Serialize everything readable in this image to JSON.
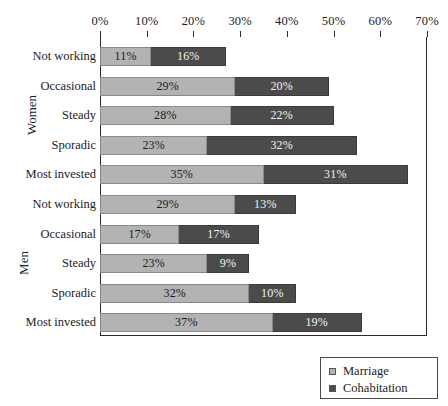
{
  "chart_data": {
    "type": "bar",
    "orientation": "horizontal",
    "stacked": true,
    "title": "",
    "xlabel": "",
    "ylabel": "",
    "xlim": [
      0,
      70
    ],
    "xticks": [
      0,
      10,
      20,
      30,
      40,
      50,
      60,
      70
    ],
    "xtick_labels": [
      "0%",
      "10%",
      "20%",
      "30%",
      "40%",
      "50%",
      "60%",
      "70%"
    ],
    "grid": false,
    "legend_position": "bottom-right",
    "series": [
      {
        "name": "Marriage",
        "color": "#b3b3b3",
        "values": [
          11,
          29,
          28,
          23,
          35,
          29,
          17,
          23,
          32,
          37
        ]
      },
      {
        "name": "Cohabitation",
        "color": "#4b4b4b",
        "values": [
          16,
          20,
          22,
          32,
          31,
          13,
          17,
          9,
          10,
          19
        ]
      }
    ],
    "groups": [
      {
        "label": "Women",
        "categories": [
          "Not working",
          "Occasional",
          "Steady",
          "Sporadic",
          "Most invested"
        ]
      },
      {
        "label": "Men",
        "categories": [
          "Not working",
          "Occasional",
          "Steady",
          "Sporadic",
          "Most invested"
        ]
      }
    ],
    "bars": [
      {
        "group": "Women",
        "category": "Not working",
        "marriage": 11,
        "cohabitation": 16,
        "marriage_label": "11%",
        "cohabitation_label": "16%"
      },
      {
        "group": "Women",
        "category": "Occasional",
        "marriage": 29,
        "cohabitation": 20,
        "marriage_label": "29%",
        "cohabitation_label": "20%"
      },
      {
        "group": "Women",
        "category": "Steady",
        "marriage": 28,
        "cohabitation": 22,
        "marriage_label": "28%",
        "cohabitation_label": "22%"
      },
      {
        "group": "Women",
        "category": "Sporadic",
        "marriage": 23,
        "cohabitation": 32,
        "marriage_label": "23%",
        "cohabitation_label": "32%"
      },
      {
        "group": "Women",
        "category": "Most invested",
        "marriage": 35,
        "cohabitation": 31,
        "marriage_label": "35%",
        "cohabitation_label": "31%"
      },
      {
        "group": "Men",
        "category": "Not working",
        "marriage": 29,
        "cohabitation": 13,
        "marriage_label": "29%",
        "cohabitation_label": "13%"
      },
      {
        "group": "Men",
        "category": "Occasional",
        "marriage": 17,
        "cohabitation": 17,
        "marriage_label": "17%",
        "cohabitation_label": "17%"
      },
      {
        "group": "Men",
        "category": "Steady",
        "marriage": 23,
        "cohabitation": 9,
        "marriage_label": "23%",
        "cohabitation_label": "9%"
      },
      {
        "group": "Men",
        "category": "Sporadic",
        "marriage": 32,
        "cohabitation": 10,
        "marriage_label": "32%",
        "cohabitation_label": "10%"
      },
      {
        "group": "Men",
        "category": "Most invested",
        "marriage": 37,
        "cohabitation": 19,
        "marriage_label": "37%",
        "cohabitation_label": "19%"
      }
    ]
  },
  "legend": {
    "items": [
      {
        "label": "Marriage",
        "color": "#b3b3b3"
      },
      {
        "label": "Cohabitation",
        "color": "#4b4b4b"
      }
    ]
  }
}
